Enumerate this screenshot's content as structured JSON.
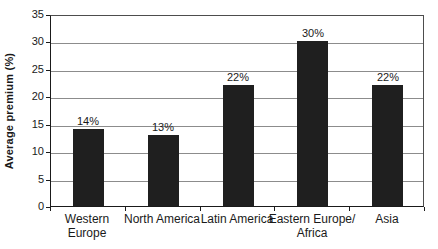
{
  "chart_data": {
    "type": "bar",
    "title": "",
    "xlabel": "",
    "ylabel": "Average premium (%)",
    "ylim": [
      0,
      35
    ],
    "ytick_step": 5,
    "yticks": [
      "0",
      "5",
      "10",
      "15",
      "20",
      "25",
      "30",
      "35"
    ],
    "grid": "horizontal",
    "legend": "none",
    "categories": [
      "Western Europe",
      "North America",
      "Latin America",
      "Eastern Europe/Africa",
      "Asia"
    ],
    "category_display_lines": [
      [
        "Western",
        "Europe"
      ],
      [
        "North America"
      ],
      [
        "Latin America"
      ],
      [
        "Eastern Europe/",
        "Africa"
      ],
      [
        "Asia"
      ]
    ],
    "values": [
      14,
      13,
      22,
      30,
      22
    ],
    "value_labels": [
      "14%",
      "13%",
      "22%",
      "30%",
      "22%"
    ],
    "colors": {
      "bar": "#1f1f1f",
      "gridline": "#8c8c8c",
      "plot_border": "#4d4d4d",
      "axis": "#1a1a1a",
      "text": "#1a1a1a",
      "background": "#ffffff"
    }
  }
}
